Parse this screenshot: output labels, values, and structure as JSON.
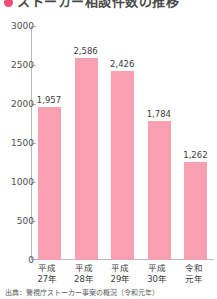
{
  "title": {
    "bullet_color": "#ef4c72",
    "text": "ストーカー相談件数の推移"
  },
  "chart_data": {
    "type": "bar",
    "title": "ストーカー相談件数の推移",
    "xlabel": "",
    "ylabel": "",
    "ylim": [
      0,
      3000
    ],
    "ytick_values": [
      0,
      500,
      1000,
      1500,
      2000,
      2500,
      3000
    ],
    "ytick_labels": [
      "0",
      "500",
      "1000",
      "1500",
      "2000",
      "2500",
      "3000"
    ],
    "grid": false,
    "legend": "none",
    "bar_color": "#f8a0b2",
    "categories": [
      "平成\n27年",
      "平成\n28年",
      "平成\n29年",
      "平成\n30年",
      "令和\n元年"
    ],
    "category_lines": [
      [
        "平成",
        "27年"
      ],
      [
        "平成",
        "28年"
      ],
      [
        "平成",
        "29年"
      ],
      [
        "平成",
        "30年"
      ],
      [
        "令和",
        "元年"
      ]
    ],
    "values": [
      1957,
      2586,
      2426,
      1784,
      1262
    ],
    "value_labels": [
      "1,957",
      "2,586",
      "2,426",
      "1,784",
      "1,262"
    ]
  },
  "source": {
    "text": "出典：警視庁ストーカー事案の概況（令和元年）"
  }
}
